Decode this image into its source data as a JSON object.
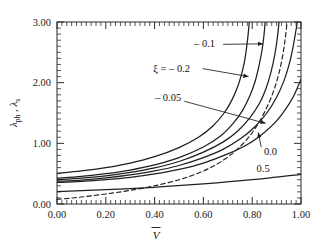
{
  "chart_data": {
    "type": "line",
    "title": "",
    "xlabel": "V̄",
    "ylabel": "λ_ph , λ_s",
    "xlim": [
      0.0,
      1.0
    ],
    "ylim": [
      0.0,
      3.0
    ],
    "xticks": [
      "0.00",
      "0.20",
      "0.40",
      "0.60",
      "0.80",
      "1.00"
    ],
    "xtick_values": [
      0.0,
      0.2,
      0.4,
      0.6,
      0.8,
      1.0
    ],
    "yticks": [
      "0.00",
      "1.00",
      "2.00",
      "3.00"
    ],
    "ytick_values": [
      0.0,
      1.0,
      2.0,
      3.0
    ],
    "grid": false,
    "legend_position": "inline-annotations",
    "minor_ticks": true,
    "annotations": [
      {
        "name": "xi-minus-0.1",
        "text": "– 0.1",
        "x": 0.605,
        "y": 2.64,
        "arrow_to_x": 0.845,
        "arrow_to_y": 2.64
      },
      {
        "name": "xi-equals-minus-0.2",
        "text": "ξ = – 0.2",
        "x": 0.47,
        "y": 2.24,
        "arrow_to_x": 0.785,
        "arrow_to_y": 2.1
      },
      {
        "name": "xi-minus-0.05",
        "text": "– 0.05",
        "x": 0.455,
        "y": 1.76,
        "arrow_to_x": 0.855,
        "arrow_to_y": 1.33
      },
      {
        "name": "xi-0.0",
        "text": "0.0",
        "x": 0.875,
        "y": 0.87,
        "arrow_to_x": 0.825,
        "arrow_to_y": 1.18
      },
      {
        "name": "xi-0.5",
        "text": "0.5",
        "x": 0.845,
        "y": 0.585
      }
    ],
    "series": [
      {
        "name": "ξ = – 0.2",
        "style": "solid",
        "label": "– 0.2",
        "points": [
          [
            0.0,
            0.505
          ],
          [
            0.1,
            0.545
          ],
          [
            0.2,
            0.6
          ],
          [
            0.3,
            0.675
          ],
          [
            0.4,
            0.78
          ],
          [
            0.5,
            0.93
          ],
          [
            0.58,
            1.1
          ],
          [
            0.64,
            1.29
          ],
          [
            0.685,
            1.5
          ],
          [
            0.715,
            1.7
          ],
          [
            0.74,
            1.93
          ],
          [
            0.755,
            2.12
          ],
          [
            0.768,
            2.34
          ],
          [
            0.776,
            2.55
          ],
          [
            0.783,
            2.78
          ],
          [
            0.788,
            3.0
          ]
        ]
      },
      {
        "name": "ξ = – 0.1",
        "style": "solid",
        "label": "– 0.1",
        "points": [
          [
            0.0,
            0.425
          ],
          [
            0.1,
            0.455
          ],
          [
            0.2,
            0.5
          ],
          [
            0.3,
            0.56
          ],
          [
            0.4,
            0.645
          ],
          [
            0.5,
            0.765
          ],
          [
            0.6,
            0.94
          ],
          [
            0.67,
            1.12
          ],
          [
            0.72,
            1.32
          ],
          [
            0.76,
            1.54
          ],
          [
            0.79,
            1.78
          ],
          [
            0.812,
            2.02
          ],
          [
            0.828,
            2.28
          ],
          [
            0.84,
            2.53
          ],
          [
            0.848,
            2.77
          ],
          [
            0.853,
            3.0
          ]
        ]
      },
      {
        "name": "ξ = – 0.05",
        "style": "solid",
        "label": "– 0.05",
        "points": [
          [
            0.0,
            0.4
          ],
          [
            0.1,
            0.425
          ],
          [
            0.2,
            0.465
          ],
          [
            0.3,
            0.52
          ],
          [
            0.4,
            0.595
          ],
          [
            0.5,
            0.7
          ],
          [
            0.6,
            0.855
          ],
          [
            0.68,
            1.02
          ],
          [
            0.74,
            1.2
          ],
          [
            0.79,
            1.42
          ],
          [
            0.83,
            1.66
          ],
          [
            0.858,
            1.92
          ],
          [
            0.878,
            2.19
          ],
          [
            0.893,
            2.47
          ],
          [
            0.903,
            2.74
          ],
          [
            0.91,
            3.0
          ]
        ]
      },
      {
        "name": "ξ = 0.0",
        "style": "solid",
        "label": "0.0",
        "points": [
          [
            0.0,
            0.375
          ],
          [
            0.1,
            0.395
          ],
          [
            0.2,
            0.43
          ],
          [
            0.3,
            0.48
          ],
          [
            0.4,
            0.545
          ],
          [
            0.5,
            0.635
          ],
          [
            0.6,
            0.765
          ],
          [
            0.68,
            0.9
          ],
          [
            0.75,
            1.07
          ],
          [
            0.81,
            1.27
          ],
          [
            0.86,
            1.5
          ],
          [
            0.9,
            1.76
          ],
          [
            0.93,
            2.03
          ],
          [
            0.952,
            2.31
          ],
          [
            0.968,
            2.6
          ],
          [
            0.98,
            2.88
          ],
          [
            0.985,
            3.0
          ]
        ]
      },
      {
        "name": "ξ intermediate",
        "style": "solid",
        "label": "",
        "points": [
          [
            0.0,
            0.355
          ],
          [
            0.1,
            0.372
          ],
          [
            0.2,
            0.4
          ],
          [
            0.3,
            0.44
          ],
          [
            0.4,
            0.495
          ],
          [
            0.5,
            0.57
          ],
          [
            0.6,
            0.675
          ],
          [
            0.7,
            0.825
          ],
          [
            0.78,
            0.98
          ],
          [
            0.85,
            1.18
          ],
          [
            0.9,
            1.37
          ],
          [
            0.94,
            1.58
          ],
          [
            0.97,
            1.78
          ],
          [
            0.99,
            1.96
          ],
          [
            1.0,
            2.06
          ]
        ]
      },
      {
        "name": "ξ = 0.5",
        "style": "solid",
        "label": "0.5",
        "points": [
          [
            0.0,
            0.205
          ],
          [
            0.2,
            0.235
          ],
          [
            0.4,
            0.275
          ],
          [
            0.6,
            0.33
          ],
          [
            0.8,
            0.4
          ],
          [
            1.0,
            0.49
          ]
        ]
      },
      {
        "name": "λ_s (spinodal)",
        "style": "dashed",
        "label": "",
        "points": [
          [
            0.0,
            0.075
          ],
          [
            0.1,
            0.115
          ],
          [
            0.2,
            0.165
          ],
          [
            0.3,
            0.225
          ],
          [
            0.4,
            0.3
          ],
          [
            0.5,
            0.4
          ],
          [
            0.58,
            0.51
          ],
          [
            0.65,
            0.645
          ],
          [
            0.71,
            0.805
          ],
          [
            0.76,
            0.985
          ],
          [
            0.8,
            1.175
          ],
          [
            0.835,
            1.395
          ],
          [
            0.865,
            1.635
          ],
          [
            0.888,
            1.865
          ],
          [
            0.905,
            2.085
          ],
          [
            0.918,
            2.3
          ],
          [
            0.928,
            2.52
          ],
          [
            0.936,
            2.745
          ],
          [
            0.942,
            2.96
          ]
        ]
      }
    ]
  },
  "frame": {
    "left_px": 57,
    "right_px": 301,
    "top_px": 22,
    "bottom_px": 204
  }
}
